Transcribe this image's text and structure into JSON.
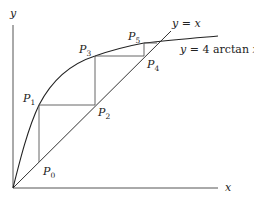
{
  "diagram": {
    "title": "",
    "axes": {
      "x_label": "x",
      "y_label": "y"
    },
    "curves": [
      {
        "name": "line-y-equals-x",
        "label_var": "y",
        "label_eq": " = ",
        "label_rhs": "x"
      },
      {
        "name": "curve-4-arctan",
        "label_var": "y",
        "label_eq": " = 4 ",
        "label_fn": "arctan",
        "label_arg": "x"
      }
    ],
    "points": [
      {
        "id": "P0",
        "base": "P",
        "sub": "0"
      },
      {
        "id": "P1",
        "base": "P",
        "sub": "1"
      },
      {
        "id": "P2",
        "base": "P",
        "sub": "2"
      },
      {
        "id": "P3",
        "base": "P",
        "sub": "3"
      },
      {
        "id": "P4",
        "base": "P",
        "sub": "4"
      },
      {
        "id": "P5",
        "base": "P",
        "sub": "5"
      }
    ],
    "colors": {
      "axis": "#444444",
      "curve": "#222222",
      "cobweb": "#555555"
    }
  }
}
